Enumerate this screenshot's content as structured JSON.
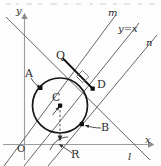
{
  "figure": {
    "kind": "geometry-diagram",
    "width": 161,
    "height": 166,
    "colors": {
      "stroke": "#55565a",
      "axis": "#8b8d91",
      "circle": "#1a1a1a",
      "point": "#111111",
      "label": "#2b2b2b",
      "background": "#fdfdfd"
    }
  },
  "axes": {
    "y_label": "y",
    "x_label": "x",
    "origin_label": "O"
  },
  "lines": [
    {
      "name": "m",
      "label": "m",
      "slope": 1
    },
    {
      "name": "y=x",
      "label": "y=x",
      "slope": 1
    },
    {
      "name": "n",
      "label": "n",
      "slope": 1
    },
    {
      "name": "l",
      "label": "l",
      "slope": -1
    }
  ],
  "points": [
    {
      "name": "A",
      "label": "A",
      "role": "point-on-circle"
    },
    {
      "name": "B",
      "label": "B",
      "role": "point-on-circle"
    },
    {
      "name": "C",
      "label": "C",
      "role": "circle-center"
    },
    {
      "name": "D",
      "label": "D",
      "role": "point-on-circle"
    },
    {
      "name": "Q",
      "label": "Q",
      "role": "intersection"
    },
    {
      "name": "R",
      "label": "R",
      "role": "tangent-point-on-x-axis"
    }
  ],
  "marks": {
    "right_angle": "right-angle-mark-at-D",
    "radius_arrow": "radius-arrow-from-C-to-R"
  },
  "top_strip": {
    "present": true,
    "note": "faint cropped text row at very top of the scan"
  }
}
